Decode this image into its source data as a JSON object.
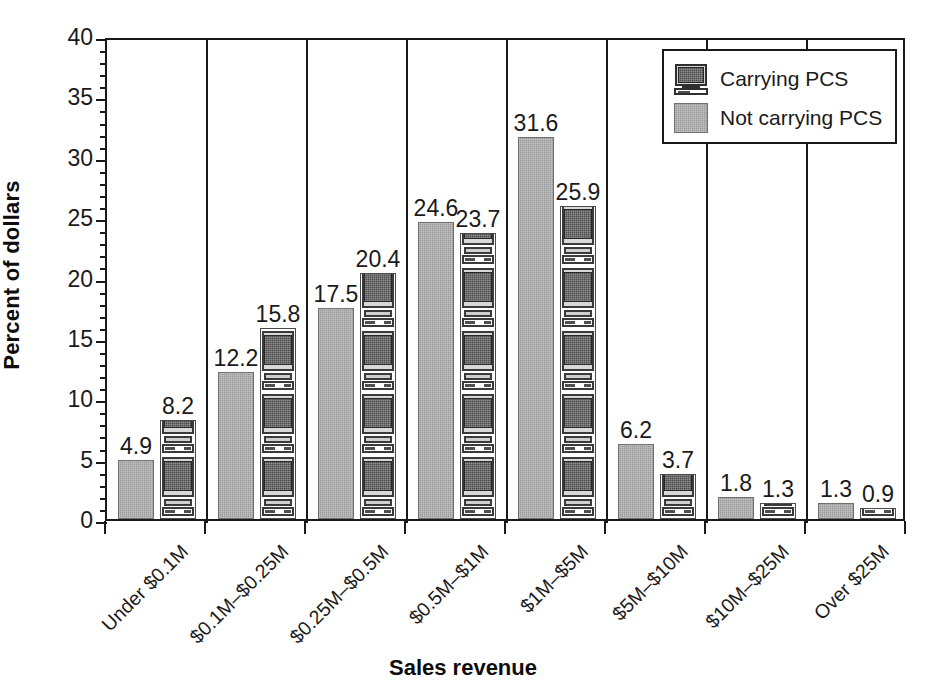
{
  "chart_data": {
    "type": "bar",
    "title": "",
    "xlabel": "Sales revenue",
    "ylabel": "Percent of dollars",
    "ylim": [
      0,
      40
    ],
    "ytick_major_step": 5,
    "ytick_minor_step": 1,
    "yticks": [
      "0",
      "5",
      "10",
      "15",
      "20",
      "25",
      "30",
      "35",
      "40"
    ],
    "grid": false,
    "legend_position": "top-right",
    "group_separators": true,
    "categories": [
      "Under $0.1M",
      "$0.1M–$0.25M",
      "$0.25M–$0.5M",
      "$0.5M–$1M",
      "$1M–$5M",
      "$5M–$10M",
      "$10M–$25M",
      "Over $25M"
    ],
    "series": [
      {
        "name": "Not carrying PCS",
        "fill": "solid-gray",
        "color": "#9a9a9a",
        "values": [
          4.9,
          12.2,
          17.5,
          24.6,
          31.6,
          6.2,
          1.8,
          1.3
        ],
        "labels": [
          "4.9",
          "12.2",
          "17.5",
          "24.6",
          "31.6",
          "6.2",
          "1.8",
          "1.3"
        ]
      },
      {
        "name": "Carrying PCS",
        "fill": "pc-monitor-pattern",
        "color": "#4f4f4f",
        "values": [
          8.2,
          15.8,
          20.4,
          23.7,
          25.9,
          3.7,
          1.3,
          0.9
        ],
        "labels": [
          "8.2",
          "15.8",
          "20.4",
          "23.7",
          "25.9",
          "3.7",
          "1.3",
          "0.9"
        ]
      }
    ]
  },
  "axes": {
    "y_title": "Percent of dollars",
    "x_title": "Sales revenue"
  },
  "legend": {
    "entries": [
      {
        "label": "Carrying PCS",
        "swatch": "pc-monitor-icon"
      },
      {
        "label": "Not carrying PCS",
        "swatch": "gray-square"
      }
    ]
  },
  "colors": {
    "gray_bar": "#9a9a9a",
    "pc_screen": "#4f4f4f",
    "axis": "#1a1a1a",
    "background": "#ffffff"
  }
}
